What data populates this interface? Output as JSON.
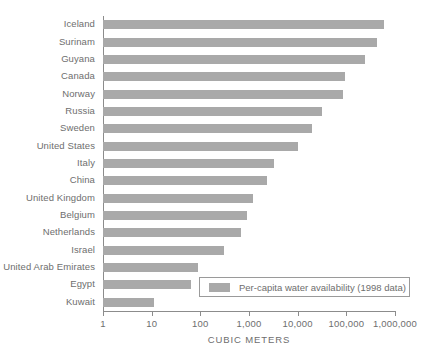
{
  "chart_data": {
    "type": "bar",
    "orientation": "horizontal",
    "title": "",
    "xlabel": "CUBIC METERS",
    "ylabel": "",
    "xscale": "log",
    "xlim": [
      1,
      1000000
    ],
    "grid": false,
    "legend_position": "bottom-right",
    "categories": [
      "Iceland",
      "Surinam",
      "Guyana",
      "Canada",
      "Norway",
      "Russia",
      "Sweden",
      "United States",
      "Italy",
      "China",
      "United Kingdom",
      "Belgium",
      "Netherlands",
      "Israel",
      "United Arab Emirates",
      "Egypt",
      "Kuwait"
    ],
    "values": [
      605000,
      425000,
      241000,
      94000,
      85000,
      31000,
      20000,
      10000,
      3300,
      2300,
      1200,
      900,
      670,
      300,
      90,
      63,
      11
    ],
    "tick_values": [
      1,
      10,
      100,
      1000,
      10000,
      100000,
      1000000
    ],
    "tick_labels": [
      "1",
      "10",
      "100",
      "1,000",
      "10,000",
      "100,000",
      "1,000,000"
    ],
    "series": [
      {
        "name": "Per-capita water availability (1998 data)",
        "color": "#a9a9a9"
      }
    ],
    "legend": [
      {
        "label": "Per-capita water availability (1998 data)",
        "color": "#a9a9a9"
      }
    ]
  },
  "colors": {
    "bar": "#a9a9a9",
    "axis": "#8c8c8c",
    "text": "#6e6e6e",
    "background": "#ffffff",
    "legend_border": "#9a9a9a"
  }
}
